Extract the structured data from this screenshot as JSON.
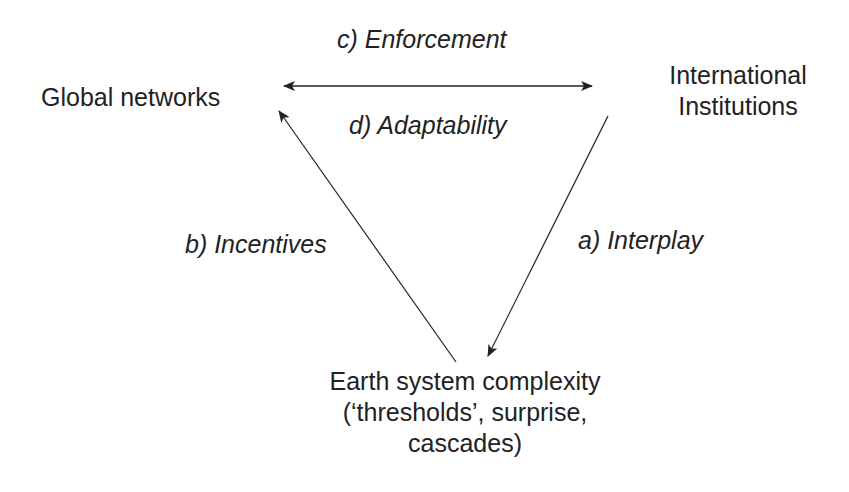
{
  "nodes": {
    "global_networks": {
      "label": "Global networks"
    },
    "international_institutions": {
      "line1": "International",
      "line2": "Institutions"
    },
    "earth_system": {
      "line1": "Earth system complexity",
      "line2": "(‘thresholds’, surprise,",
      "line3": "cascades)"
    }
  },
  "edges": {
    "enforcement": {
      "label": "c) Enforcement",
      "from": "Global networks",
      "to": "International Institutions",
      "direction": "bidirectional"
    },
    "adaptability": {
      "label": "d) Adaptability",
      "from": "Global networks",
      "to": "International Institutions",
      "direction": "bidirectional"
    },
    "interplay": {
      "label": "a) Interplay",
      "from": "International Institutions",
      "to": "Earth system complexity"
    },
    "incentives": {
      "label": "b) Incentives",
      "from": "Earth system complexity",
      "to": "Global networks"
    }
  },
  "colors": {
    "line": "#222222",
    "text": "#222222",
    "background": "#ffffff"
  }
}
